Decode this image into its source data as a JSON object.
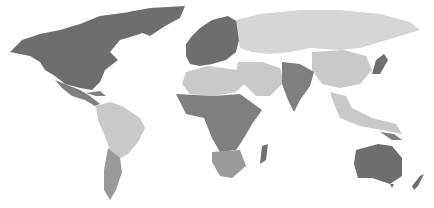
{
  "map": {
    "type": "choropleth world map (grayscale)",
    "colors": {
      "background": "#ffffff",
      "dark": "#6e6e6e",
      "medium_dark": "#7f7f7f",
      "medium": "#9a9a9a",
      "light": "#c9c9c9",
      "lighter": "#d6d6d6"
    },
    "regions": [
      {
        "name": "north-america",
        "shade": "dark"
      },
      {
        "name": "greenland",
        "shade": "dark"
      },
      {
        "name": "mexico-central-america",
        "shade": "medium_dark"
      },
      {
        "name": "south-america-north",
        "shade": "light"
      },
      {
        "name": "south-america-south",
        "shade": "medium"
      },
      {
        "name": "europe",
        "shade": "dark"
      },
      {
        "name": "russia-central-asia",
        "shade": "lighter"
      },
      {
        "name": "north-africa",
        "shade": "light"
      },
      {
        "name": "sub-saharan-africa",
        "shade": "medium_dark"
      },
      {
        "name": "southern-africa",
        "shade": "medium"
      },
      {
        "name": "middle-east",
        "shade": "light"
      },
      {
        "name": "south-asia",
        "shade": "medium_dark"
      },
      {
        "name": "east-asia",
        "shade": "light"
      },
      {
        "name": "japan",
        "shade": "dark"
      },
      {
        "name": "southeast-asia",
        "shade": "light"
      },
      {
        "name": "australia",
        "shade": "dark"
      },
      {
        "name": "new-zealand",
        "shade": "dark"
      },
      {
        "name": "madagascar",
        "shade": "dark"
      }
    ]
  }
}
